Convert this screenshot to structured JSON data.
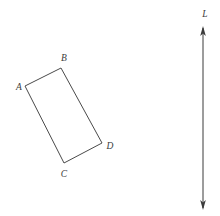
{
  "figure": {
    "canvas": {
      "width": 220,
      "height": 216,
      "background": "#ffffff"
    },
    "stroke_color": "#4a4a4a",
    "label_color": "#3b3b3b",
    "shape": {
      "name": "rectangle-abcd",
      "type": "rectangle",
      "closed": true,
      "vertices": [
        {
          "id": "A",
          "label": "A",
          "x": 25,
          "y": 86,
          "label_x": 19,
          "label_y": 88
        },
        {
          "id": "B",
          "label": "B",
          "x": 61,
          "y": 68,
          "label_x": 64,
          "label_y": 59
        },
        {
          "id": "C",
          "label": "C",
          "x": 64,
          "y": 163,
          "label_x": 64,
          "label_y": 175
        },
        {
          "id": "D",
          "label": "D",
          "x": 102,
          "y": 143,
          "label_x": 110,
          "label_y": 147
        }
      ],
      "edges": [
        {
          "from": "A",
          "to": "B"
        },
        {
          "from": "B",
          "to": "D"
        },
        {
          "from": "D",
          "to": "C"
        },
        {
          "from": "C",
          "to": "A"
        }
      ],
      "path": "M 25 86 L 61 68 L 102 143 L 64 163 Z"
    },
    "axis": {
      "name": "line-L",
      "label": "L",
      "label_x": 205,
      "label_y": 15,
      "x": 203,
      "y_top": 28,
      "y_bottom": 208,
      "arrow_top": true,
      "arrow_bottom": true,
      "color": "#3a3a3a"
    }
  }
}
